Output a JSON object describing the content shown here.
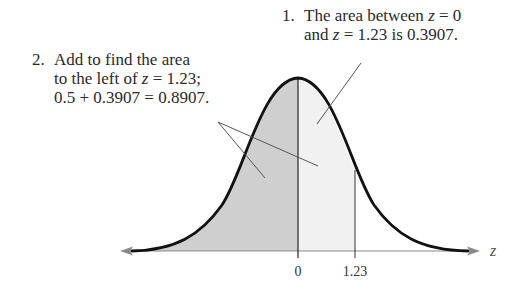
{
  "diagram": {
    "type": "standard-normal-curve",
    "shaded_regions": [
      {
        "from": "-inf",
        "to": 0,
        "shade": "#cfcfcf"
      },
      {
        "from": 0,
        "to": 1.23,
        "shade": "#f1f1f1"
      }
    ],
    "axis": {
      "label": "z",
      "ticks": [
        "0",
        "1.23"
      ]
    }
  },
  "notes": {
    "note1": {
      "number": "1.",
      "line1_a": "The area between ",
      "line1_var": "z",
      "line1_b": " = 0",
      "line2_a": "and ",
      "line2_var": "z",
      "line2_b": " = 1.23 is 0.3907."
    },
    "note2": {
      "number": "2.",
      "line1": "Add to find the area",
      "line2_a": "to the left of ",
      "line2_var": "z",
      "line2_b": " = 1.23;",
      "line3": "0.5 + 0.3907 = 0.8907."
    }
  },
  "axis": {
    "label": "z",
    "tick_0": "0",
    "tick_123": "1.23"
  },
  "colors": {
    "left_shade": "#cfcfcf",
    "middle_shade": "#f1f1f1",
    "curve": "#111111",
    "axis": "#8a8a8a",
    "leader": "#555555"
  }
}
